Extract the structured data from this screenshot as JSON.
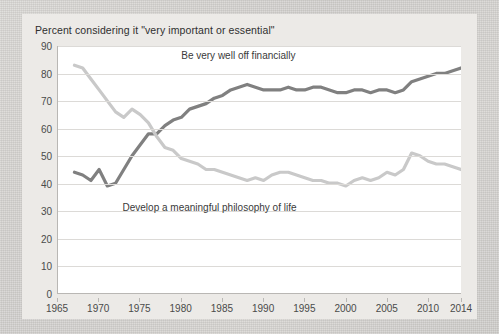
{
  "title": "Percent considering it \"very important or essential\"",
  "colors": {
    "series_financial": "#808080",
    "series_philosophy": "#c9c9c9",
    "grid": "#dcdad7",
    "axis": "#b9b7b4",
    "plot_background": "#ffffff",
    "card_background": "#eceae7",
    "page_background": "#d8d6d3",
    "text": "#3a3a3a"
  },
  "annotations": [
    {
      "name": "label-be-very-well-off-financially",
      "text": "Be very well off financially",
      "x": 1987,
      "y": 86
    },
    {
      "name": "label-develop-a-meaningful-philosophy-of-life",
      "text": "Develop a meaningful philosophy of life",
      "x": 1983.5,
      "y": 31
    }
  ],
  "chart_data": {
    "type": "line",
    "title": "Percent considering it \"very important or essential\"",
    "xlabel": "",
    "ylabel": "",
    "xlim": [
      1965,
      2014
    ],
    "ylim": [
      0,
      90
    ],
    "yticks": [
      0,
      10,
      20,
      30,
      40,
      50,
      60,
      70,
      80,
      90
    ],
    "xticks": [
      1965,
      1970,
      1975,
      1980,
      1985,
      1990,
      1995,
      2000,
      2005,
      2010,
      2014
    ],
    "grid": "horizontal",
    "legend": "inline-annotations",
    "x": [
      1967,
      1968,
      1969,
      1970,
      1971,
      1972,
      1973,
      1974,
      1975,
      1976,
      1977,
      1978,
      1979,
      1980,
      1981,
      1982,
      1983,
      1984,
      1985,
      1986,
      1987,
      1988,
      1989,
      1990,
      1991,
      1992,
      1993,
      1994,
      1995,
      1996,
      1997,
      1998,
      1999,
      2000,
      2001,
      2002,
      2003,
      2004,
      2005,
      2006,
      2007,
      2008,
      2009,
      2010,
      2011,
      2012,
      2013,
      2014
    ],
    "series": [
      {
        "name": "Be very well off financially",
        "color": "#808080",
        "values": [
          44,
          43,
          41,
          45,
          39,
          40,
          45,
          50,
          54,
          58,
          58,
          61,
          63,
          64,
          67,
          68,
          69,
          71,
          72,
          74,
          75,
          76,
          75,
          74,
          74,
          74,
          75,
          74,
          74,
          75,
          75,
          74,
          73,
          73,
          74,
          74,
          73,
          74,
          74,
          73,
          74,
          77,
          78,
          79,
          80,
          80,
          81,
          82
        ]
      },
      {
        "name": "Develop a meaningful philosophy of life",
        "color": "#c9c9c9",
        "values": [
          83,
          82,
          78,
          74,
          70,
          66,
          64,
          67,
          65,
          62,
          57,
          53,
          52,
          49,
          48,
          47,
          45,
          45,
          44,
          43,
          42,
          41,
          42,
          41,
          43,
          44,
          44,
          43,
          42,
          41,
          41,
          40,
          40,
          39,
          41,
          42,
          41,
          42,
          44,
          43,
          45,
          51,
          50,
          48,
          47,
          47,
          46,
          45
        ]
      }
    ]
  }
}
